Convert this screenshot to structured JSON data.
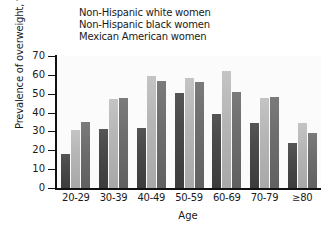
{
  "chart_data": {
    "type": "bar",
    "title": "",
    "xlabel": "Age",
    "ylabel": "Prevalence of overweight, %",
    "categories": [
      "20-29",
      "30-39",
      "40-49",
      "50-59",
      "60-69",
      "70-79",
      "≥80"
    ],
    "series": [
      {
        "name": "Non-Hispanic white women",
        "color": "#4a4a4a",
        "values": [
          18,
          31.5,
          32,
          50.5,
          39.5,
          34.5,
          24
        ]
      },
      {
        "name": "Non-Hispanic black women",
        "color": "#b6b6b6",
        "values": [
          31,
          47,
          59.5,
          58.5,
          62,
          48,
          34.5
        ]
      },
      {
        "name": "Mexican American women",
        "color": "#6e6e6e",
        "values": [
          35,
          48,
          57,
          56,
          51,
          48.5,
          29
        ]
      }
    ],
    "ylim": [
      0,
      70
    ],
    "yticks": [
      0,
      10,
      20,
      30,
      40,
      50,
      60,
      70
    ],
    "ytick_labels": [
      "0",
      "10",
      "20",
      "30",
      "40",
      "50",
      "60",
      "70"
    ],
    "grid": false,
    "legend_position": "top-left"
  }
}
